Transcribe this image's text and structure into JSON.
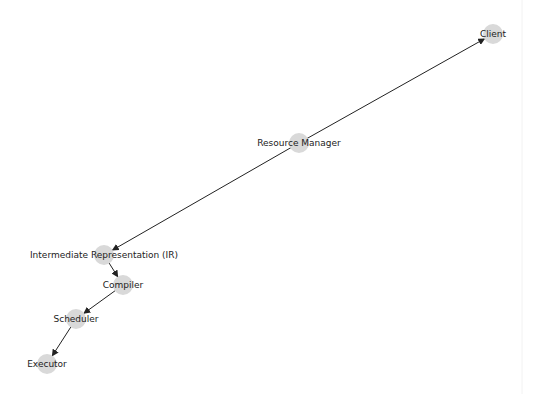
{
  "diagram": {
    "type": "directed-graph",
    "node_color": "#d9d9d9",
    "edge_color": "#222222",
    "label_color": "#222222",
    "nodes": [
      {
        "id": "client",
        "label": "Client",
        "x": 493,
        "y": 34
      },
      {
        "id": "resource-manager",
        "label": "Resource Manager",
        "x": 299,
        "y": 143
      },
      {
        "id": "ir",
        "label": "Intermediate Representation (IR)",
        "x": 104,
        "y": 255
      },
      {
        "id": "compiler",
        "label": "Compiler",
        "x": 123,
        "y": 285
      },
      {
        "id": "scheduler",
        "label": "Scheduler",
        "x": 76,
        "y": 319
      },
      {
        "id": "executor",
        "label": "Executor",
        "x": 47,
        "y": 364
      }
    ],
    "edges": [
      {
        "from": "resource-manager",
        "to": "client"
      },
      {
        "from": "resource-manager",
        "to": "ir"
      },
      {
        "from": "ir",
        "to": "compiler"
      },
      {
        "from": "compiler",
        "to": "scheduler"
      },
      {
        "from": "scheduler",
        "to": "executor"
      }
    ]
  }
}
